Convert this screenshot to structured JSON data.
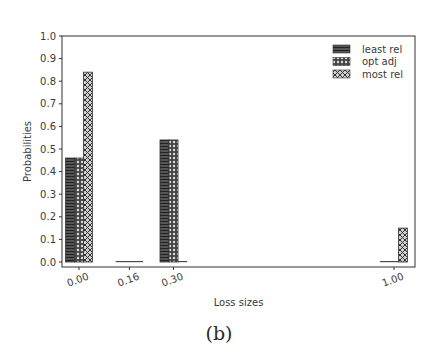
{
  "chart_data": {
    "type": "bar",
    "title": "",
    "xlabel": "Loss sizes",
    "ylabel": "Probabilities",
    "x": [
      0.0,
      0.16,
      0.3,
      1.0
    ],
    "categories": [
      "0.00",
      "0.16",
      "0.30",
      "1.00"
    ],
    "series": [
      {
        "name": "least rel",
        "hatch": "horizontal-lines",
        "values": [
          0.46,
          0.0,
          0.54,
          0.0
        ]
      },
      {
        "name": "opt adj",
        "hatch": "small-circles",
        "values": [
          0.46,
          0.0,
          0.54,
          0.0
        ]
      },
      {
        "name": "most rel",
        "hatch": "cross-circles",
        "values": [
          0.84,
          0.0,
          0.0,
          0.15
        ]
      }
    ],
    "ylim": [
      0.0,
      1.0
    ],
    "yticks": [
      "0.0",
      "0.1",
      "0.2",
      "0.3",
      "0.4",
      "0.5",
      "0.6",
      "0.7",
      "0.8",
      "0.9",
      "1.0"
    ],
    "xticks_rotated": true,
    "grid": false,
    "legend_position": "upper right"
  },
  "caption": "(b)"
}
